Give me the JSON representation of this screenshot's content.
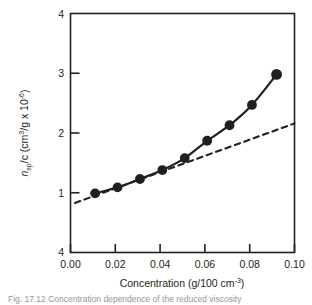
{
  "figure": {
    "background_color": "#ffffff",
    "ink_color": "#231f20"
  },
  "caption": {
    "text": "Fig. 17.12  Concentration dependence of the reduced viscosity"
  },
  "chart_data": {
    "type": "line",
    "title": "",
    "subtitle": "",
    "xlabel": "Concentration (g/100 cm",
    "xlabel_sup": "-3",
    "xlabel_tail": ")",
    "ylabel_symbol": "n",
    "ylabel_symbol_sub": "sp",
    "ylabel_mid": "/c (cm",
    "ylabel_sup1": "3",
    "ylabel_mid2": "/g x 10",
    "ylabel_sup2": "-6",
    "ylabel_tail": ")",
    "xlim": [
      0.0,
      0.1
    ],
    "ylim": [
      0.0,
      4.0
    ],
    "xticks": [
      0.0,
      0.02,
      0.04,
      0.06,
      0.08,
      0.1
    ],
    "xtick_labels": [
      "0.00",
      "0.02",
      "0.04",
      "0.06",
      "0.08",
      "0.10"
    ],
    "yticks": [
      4,
      3,
      2,
      1,
      4
    ],
    "ytick_labels": [
      "4",
      "3",
      "2",
      "1",
      "4"
    ],
    "ytick_values": [
      4.0,
      3.0,
      2.0,
      1.0,
      0.0
    ],
    "grid": false,
    "legend": false,
    "series": [
      {
        "name": "measured reduced viscosity",
        "style": "solid-with-markers",
        "marker": "filled-circle",
        "x": [
          0.011,
          0.021,
          0.031,
          0.041,
          0.051,
          0.061,
          0.071,
          0.081,
          0.092
        ],
        "y": [
          0.99,
          1.09,
          1.23,
          1.38,
          1.58,
          1.87,
          2.13,
          2.47,
          2.98
        ]
      },
      {
        "name": "limiting tangent (intrinsic viscosity)",
        "style": "dashed",
        "marker": "none",
        "x": [
          0.002,
          0.1
        ],
        "y": [
          0.83,
          2.16
        ]
      }
    ]
  }
}
